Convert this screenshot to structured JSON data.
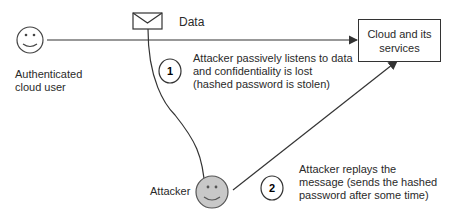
{
  "diagram": {
    "nodes": {
      "user": {
        "label": "Authenticated\ncloud user",
        "label_line1": "Authenticated",
        "label_line2": "cloud user",
        "icon": "smiley-face-icon"
      },
      "cloud": {
        "label_line1": "Cloud and its",
        "label_line2": "services"
      },
      "attacker": {
        "label": "Attacker",
        "icon": "smiley-face-icon",
        "fill": "#c8c8c8"
      },
      "data": {
        "label": "Data",
        "icon": "envelope-icon"
      }
    },
    "steps": [
      {
        "number": "1",
        "lines": [
          "Attacker passively listens to data",
          "and confidentiality is lost",
          "(hashed password is stolen)"
        ]
      },
      {
        "number": "2",
        "lines": [
          "Attacker replays the",
          "message (sends the hashed",
          "password after some time)"
        ]
      }
    ],
    "colors": {
      "line": "#333333",
      "attacker_fill": "#c8c8c8"
    }
  }
}
